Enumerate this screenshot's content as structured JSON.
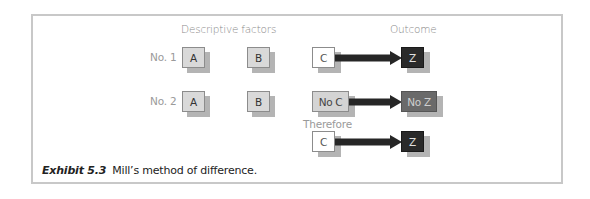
{
  "diagram": {
    "headers": {
      "descriptive": "Descriptive factors",
      "outcome": "Outcome"
    },
    "rows": [
      {
        "label": "No. 1",
        "a": "A",
        "b": "B",
        "cause": "C",
        "effect": "Z"
      },
      {
        "label": "No. 2",
        "a": "A",
        "b": "B",
        "cause": "No C",
        "effect": "No Z"
      }
    ],
    "conclusion": {
      "label": "Therefore",
      "cause": "C",
      "effect": "Z"
    },
    "colors": {
      "factor_box": "#d9d9d9",
      "cause_box": "#ffffff",
      "no_cause_box": "#d4d4d4",
      "effect_box": "#2a2a2a",
      "no_effect_box": "#6a6a6a",
      "arrow": "#262626",
      "shadow": "#b4b4b4",
      "frame": "#c8c8c8"
    }
  },
  "caption": {
    "label": "Exhibit 5.3",
    "text": "Mill’s method of difference."
  }
}
